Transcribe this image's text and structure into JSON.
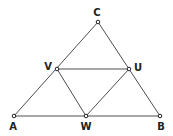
{
  "diagram": {
    "title": "",
    "points": [
      {
        "id": "A",
        "label": "A",
        "x": 14,
        "y": 116,
        "lx": 13,
        "ly": 130
      },
      {
        "id": "B",
        "label": "B",
        "x": 160,
        "y": 116,
        "lx": 161,
        "ly": 130
      },
      {
        "id": "C",
        "label": "C",
        "x": 98,
        "y": 22,
        "lx": 97,
        "ly": 16
      },
      {
        "id": "U",
        "label": "U",
        "x": 129,
        "y": 69,
        "lx": 138,
        "ly": 71
      },
      {
        "id": "V",
        "label": "V",
        "x": 57,
        "y": 69,
        "lx": 48,
        "ly": 70
      },
      {
        "id": "W",
        "label": "W",
        "x": 86,
        "y": 116,
        "lx": 86,
        "ly": 130
      }
    ],
    "segments": [
      [
        "A",
        "B"
      ],
      [
        "A",
        "C"
      ],
      [
        "B",
        "C"
      ],
      [
        "V",
        "U"
      ],
      [
        "V",
        "W"
      ],
      [
        "U",
        "W"
      ]
    ]
  }
}
